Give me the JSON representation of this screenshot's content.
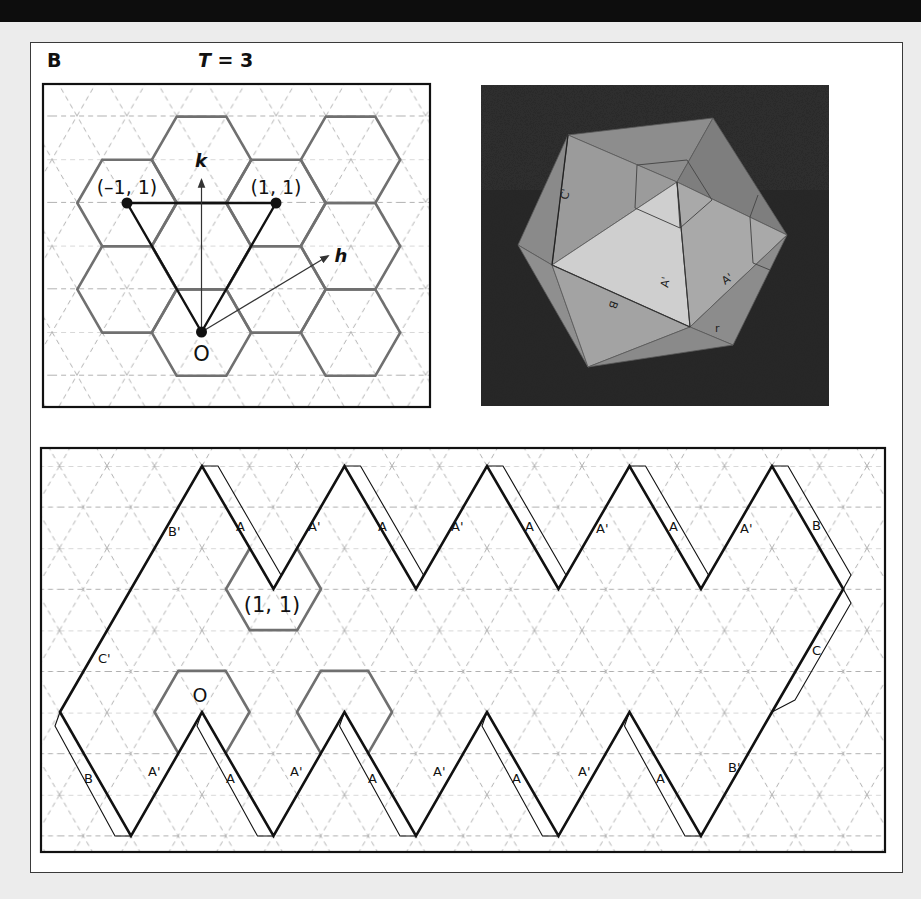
{
  "figure": {
    "panel_letter": "B",
    "title_var": "T",
    "title_rest": " = 3"
  },
  "lattice_panel": {
    "point_labels": {
      "neg1_1": "(–1, 1)",
      "pos1_1": "(1, 1)",
      "origin": "O"
    },
    "vector_labels": {
      "k": "k",
      "h": "h"
    }
  },
  "photo_panel": {
    "description": "Photograph of a folded paper T = 3 icosahedral model on dark background",
    "face_labels": [
      "C'",
      "A'",
      "A'",
      "B",
      "r"
    ]
  },
  "net_panel": {
    "hex_labels": {
      "upper": "(1, 1)",
      "origin": "O"
    },
    "edge_labels": {
      "top_left_upper": "B'",
      "top_left_lower": "C'",
      "top_A1": "A",
      "top_Ap1": "A'",
      "top_A2": "A",
      "top_Ap2": "A'",
      "top_A3": "A",
      "top_Ap3": "A'",
      "top_A4": "A",
      "top_Ap4": "A'",
      "right_B": "B",
      "right_C": "C",
      "bottom_B": "B",
      "bottom_Ap1": "A'",
      "bottom_A1": "A",
      "bottom_Ap2": "A'",
      "bottom_A2": "A",
      "bottom_Ap3": "A'",
      "bottom_A3": "A",
      "bottom_Ap4": "A'",
      "bottom_A4": "A",
      "bottom_right_Bp": "B'"
    }
  },
  "colors": {
    "background": "#ececec",
    "frame": "#3a3a3a",
    "grid_dash": "#a8a8a8",
    "hexagon": "#707070",
    "outline": "#111111",
    "photo_bg": "#2b2b2b"
  }
}
